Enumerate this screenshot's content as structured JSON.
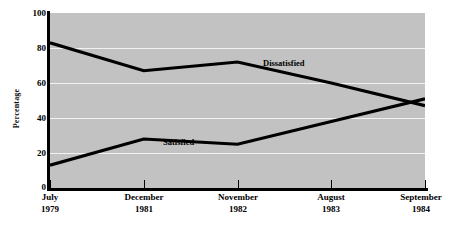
{
  "chart_data": {
    "type": "line",
    "title": "",
    "xlabel": "",
    "ylabel": "Percentage",
    "ylim": [
      0,
      100
    ],
    "yticks": [
      0,
      20,
      40,
      60,
      80,
      100
    ],
    "grid": "horizontal white gridlines at 20, 40, 60, 80",
    "legend": "inline series labels on plot",
    "categories": [
      "July 1979",
      "December 1981",
      "November 1982",
      "August 1983",
      "September 1984"
    ],
    "category_months": [
      "July",
      "December",
      "November",
      "August",
      "September"
    ],
    "category_years": [
      "1979",
      "1981",
      "1982",
      "1983",
      "1984"
    ],
    "series": [
      {
        "name": "Dissatisfied",
        "values": [
          83,
          67,
          72,
          60,
          47
        ]
      },
      {
        "name": "Satisfied",
        "values": [
          13,
          28,
          25,
          38,
          51
        ]
      }
    ],
    "annotations": [
      {
        "text": "Dissatisfied",
        "near_category": "November 1982"
      },
      {
        "text": "Satisfied",
        "near_category": "December 1981"
      }
    ]
  },
  "colors": {
    "plot_background": "#c2c2c2",
    "page_background": "#ffffff",
    "line": "#000000",
    "gridline": "#f2f2f2",
    "axis": "#000000",
    "text": "#000000"
  },
  "axis": {
    "y_title": "Percentage",
    "y_ticks": [
      "100",
      "80",
      "60",
      "40",
      "20",
      "0"
    ]
  }
}
